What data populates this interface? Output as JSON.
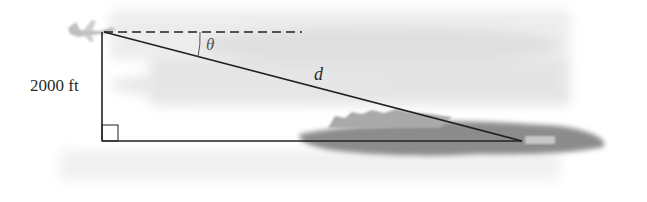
{
  "diagram": {
    "type": "right-triangle angle of depression",
    "labels": {
      "height": "2000 ft",
      "angle": "θ",
      "hypotenuse": "d"
    },
    "elements": {
      "airplane": "airplane at top vertex",
      "island": "island / city at far vertex",
      "horizontal_reference": "dashed horizontal line from airplane",
      "right_angle_marker": "square at bottom-left corner"
    },
    "colors": {
      "line": "#222222",
      "sky_haze": "#e6e6e6",
      "island": "#8a8a8a"
    }
  }
}
